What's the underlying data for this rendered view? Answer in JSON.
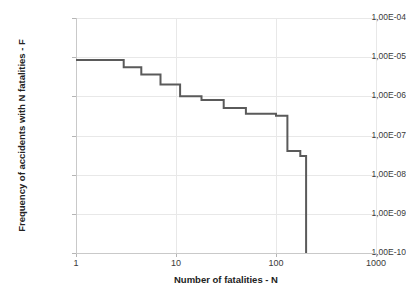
{
  "chart_data": {
    "type": "line",
    "subtype": "step-post",
    "title": "",
    "xlabel": "Number of fatalities - N",
    "ylabel": "Frequency of accidents with N fatalities - F",
    "xscale": "log",
    "yscale": "log",
    "xlim": [
      1,
      1000
    ],
    "ylim": [
      1e-10,
      0.0001
    ],
    "grid": true,
    "legend": null,
    "xticklabels": [
      "1",
      "10",
      "100",
      "1000"
    ],
    "xtickvalues": [
      1,
      10,
      100,
      1000
    ],
    "yticklabels": [
      "1,00E-04",
      "1,00E-05",
      "1,00E-06",
      "1,00E-07",
      "1,00E-08",
      "1,00E-09",
      "1,00E-10"
    ],
    "ytickvalues": [
      0.0001,
      1e-05,
      1e-06,
      1e-07,
      1e-08,
      1e-09,
      1e-10
    ],
    "series": [
      {
        "name": "F-N curve",
        "color": "#5a5a5a",
        "linewidth": 2,
        "x": [
          1,
          3,
          3,
          4.5,
          4.5,
          7,
          7,
          11,
          11,
          18,
          18,
          30,
          30,
          50,
          50,
          100,
          100,
          130,
          130,
          175,
          175,
          200,
          200
        ],
        "y": [
          8.5e-06,
          8.5e-06,
          5.5e-06,
          5.5e-06,
          3.6e-06,
          3.6e-06,
          2e-06,
          2e-06,
          1e-06,
          1e-06,
          8e-07,
          8e-07,
          5e-07,
          5e-07,
          3.6e-07,
          3.6e-07,
          3.2e-07,
          3.2e-07,
          4e-08,
          4e-08,
          3e-08,
          3e-08,
          1e-10
        ]
      }
    ]
  },
  "axes": {
    "x_title": "Number of fatalities - N",
    "y_title": "Frequency of accidents with N fatalities - F"
  },
  "colors": {
    "series": "#5a5a5a",
    "grid": "#e8e8e8",
    "axis": "#c9c9c9",
    "text": "#333333",
    "background": "#ffffff"
  }
}
